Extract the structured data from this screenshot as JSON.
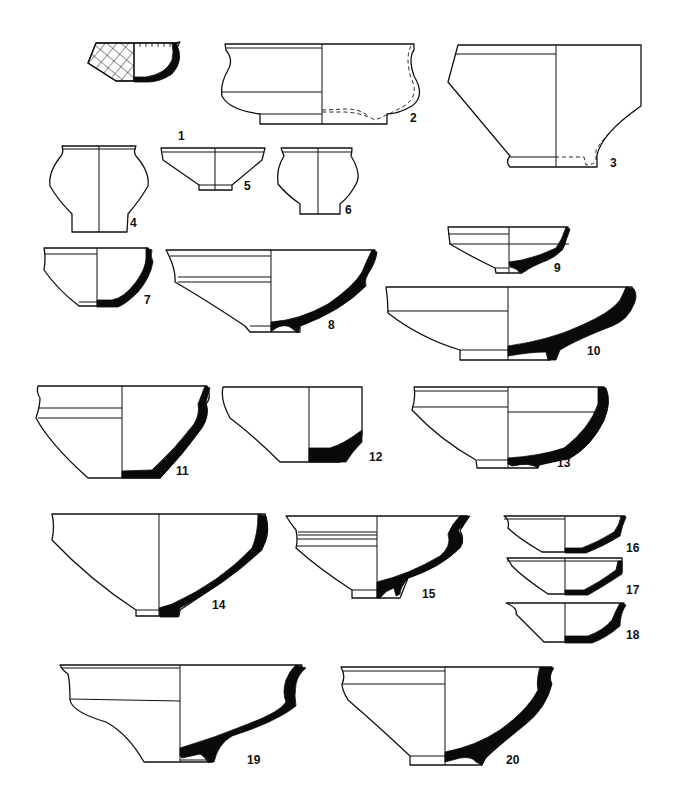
{
  "plate": {
    "background": "#ffffff",
    "ink_color": "#111111",
    "section_fill": "#0a0a0a"
  },
  "vessels": [
    {
      "id": "1",
      "label": "1",
      "x": 178,
      "y": 136
    },
    {
      "id": "2",
      "label": "2",
      "x": 410,
      "y": 118
    },
    {
      "id": "3",
      "label": "3",
      "x": 610,
      "y": 163
    },
    {
      "id": "4",
      "label": "4",
      "x": 130,
      "y": 223
    },
    {
      "id": "5",
      "label": "5",
      "x": 244,
      "y": 186
    },
    {
      "id": "6",
      "label": "6",
      "x": 345,
      "y": 210
    },
    {
      "id": "7",
      "label": "7",
      "x": 144,
      "y": 300
    },
    {
      "id": "8",
      "label": "8",
      "x": 328,
      "y": 325
    },
    {
      "id": "9",
      "label": "9",
      "x": 554,
      "y": 268
    },
    {
      "id": "10",
      "label": "10",
      "x": 587,
      "y": 351
    },
    {
      "id": "11",
      "label": "11",
      "x": 176,
      "y": 471
    },
    {
      "id": "12",
      "label": "12",
      "x": 369,
      "y": 457
    },
    {
      "id": "13",
      "label": "13",
      "x": 557,
      "y": 463
    },
    {
      "id": "14",
      "label": "14",
      "x": 212,
      "y": 605
    },
    {
      "id": "15",
      "label": "15",
      "x": 422,
      "y": 594
    },
    {
      "id": "16",
      "label": "16",
      "x": 626,
      "y": 548
    },
    {
      "id": "17",
      "label": "17",
      "x": 626,
      "y": 590
    },
    {
      "id": "18",
      "label": "18",
      "x": 626,
      "y": 635
    },
    {
      "id": "19",
      "label": "19",
      "x": 247,
      "y": 760
    },
    {
      "id": "20",
      "label": "20",
      "x": 506,
      "y": 760
    }
  ]
}
